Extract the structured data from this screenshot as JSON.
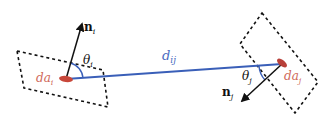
{
  "diagram": {
    "colors": {
      "line": "#3a5fb8",
      "patch": "#c8473a",
      "dashed": "#111111",
      "normal": "#111111",
      "label_blue": "#4a6bc0",
      "label_red": "#d06a5a"
    },
    "labels": {
      "n_i": "n",
      "n_i_sub": "i",
      "theta_i": "θ",
      "theta_i_sub": "i",
      "d_ij": "d",
      "d_ij_sub": "ij",
      "theta_j": "θ",
      "theta_j_sub": "j",
      "n_j": "n",
      "n_j_sub": "j",
      "da_i": "da",
      "da_i_sub": "i",
      "da_j": "da",
      "da_j_sub": "j"
    }
  }
}
